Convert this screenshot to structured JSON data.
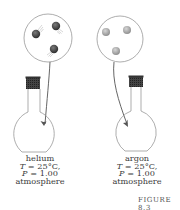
{
  "figure": {
    "caption": "FIGURE 8.3",
    "panels": [
      {
        "gas": "helium",
        "temperature_symbol": "T",
        "temperature_value": " = 25°C,",
        "pressure_symbol": "P",
        "pressure_value": " = 1.00",
        "pressure_unit": "atmosphere",
        "particle_color": "#4a4a4a",
        "particles": 3
      },
      {
        "gas": "argon",
        "temperature_symbol": "T",
        "temperature_value": " = 25°C,",
        "pressure_symbol": "P",
        "pressure_value": " = 1.00",
        "pressure_unit": "atmosphere",
        "particle_color": "#9a9a9a",
        "particles": 3
      }
    ]
  }
}
